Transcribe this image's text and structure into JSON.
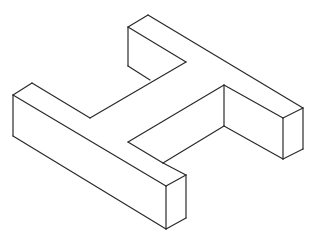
{
  "diagram": {
    "title": "",
    "stroke_color": "#2a2a2a",
    "background": "#ffffff",
    "edges": [
      [
        148,
        15,
        303,
        108
      ],
      [
        148,
        15,
        128,
        27
      ],
      [
        128,
        27,
        186,
        62
      ],
      [
        186,
        62,
        90,
        118
      ],
      [
        128,
        27,
        128,
        66
      ],
      [
        128,
        66,
        150,
        80
      ],
      [
        32,
        83,
        13,
        95
      ],
      [
        32,
        83,
        90,
        118
      ],
      [
        13,
        95,
        166,
        186
      ],
      [
        13,
        95,
        13,
        136
      ],
      [
        13,
        136,
        166,
        229
      ],
      [
        166,
        186,
        166,
        229
      ],
      [
        166,
        186,
        186,
        175
      ],
      [
        186,
        175,
        186,
        218
      ],
      [
        186,
        218,
        166,
        229
      ],
      [
        186,
        175,
        163,
        163
      ],
      [
        163,
        163,
        128,
        142
      ],
      [
        128,
        142,
        224,
        85
      ],
      [
        163,
        163,
        224,
        126
      ],
      [
        224,
        85,
        224,
        126
      ],
      [
        224,
        85,
        283,
        118
      ],
      [
        224,
        126,
        283,
        159
      ],
      [
        283,
        118,
        303,
        108
      ],
      [
        283,
        118,
        283,
        159
      ],
      [
        283,
        159,
        303,
        149
      ],
      [
        303,
        108,
        303,
        149
      ]
    ]
  }
}
